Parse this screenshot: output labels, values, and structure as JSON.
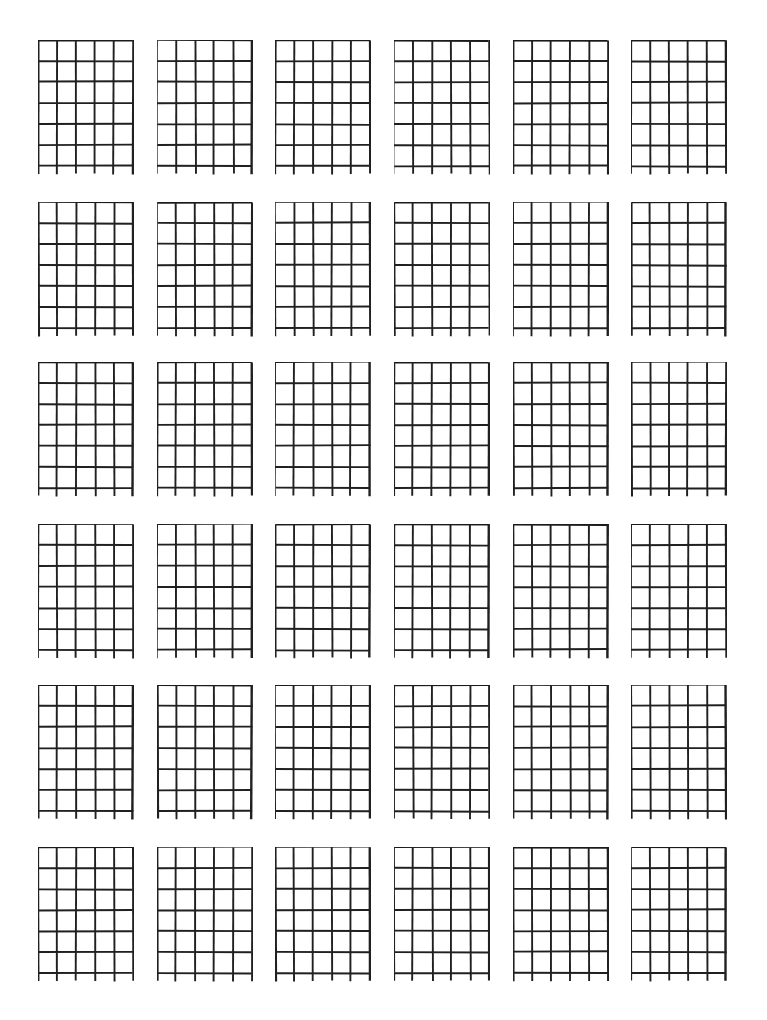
{
  "page": {
    "background_color": "#ffffff",
    "ink_color": "#211f1f",
    "width": 767,
    "height": 1020
  },
  "chart_data": {
    "type": "table",
    "subtitle": "",
    "xlabel": "",
    "ylabel": "",
    "grid_columns": 6,
    "grid_rows": 6,
    "diagram_count": 36,
    "diagram": {
      "strings": 6,
      "frets": 6,
      "fret_lines": 7,
      "nut_at_top": true,
      "string_overhang_below_last_fret_px": 8,
      "labels": [],
      "markers": []
    },
    "categories": [
      "col-1",
      "col-2",
      "col-3",
      "col-4",
      "col-5",
      "col-6"
    ],
    "values": [
      6,
      6,
      6,
      6,
      6,
      6
    ],
    "legend": [],
    "annotations": [],
    "grid": true
  },
  "layout": {
    "row_tops": [
      40,
      202,
      362,
      524,
      685,
      847
    ],
    "column_lefts": [
      38,
      157,
      275,
      394,
      513,
      631
    ],
    "diagram_width": 96,
    "diagram_height": 146,
    "fret_spacing": 21,
    "string_spacing": 19,
    "line_width_thin": 1.9,
    "line_width_thick": 2.4
  },
  "diagrams": [
    {
      "id": "chord-1",
      "row": 1,
      "col": 1,
      "name": "",
      "position": "",
      "dots": [],
      "open_strings": [],
      "muted_strings": []
    },
    {
      "id": "chord-2",
      "row": 1,
      "col": 2,
      "name": "",
      "position": "",
      "dots": [],
      "open_strings": [],
      "muted_strings": []
    },
    {
      "id": "chord-3",
      "row": 1,
      "col": 3,
      "name": "",
      "position": "",
      "dots": [],
      "open_strings": [],
      "muted_strings": []
    },
    {
      "id": "chord-4",
      "row": 1,
      "col": 4,
      "name": "",
      "position": "",
      "dots": [],
      "open_strings": [],
      "muted_strings": []
    },
    {
      "id": "chord-5",
      "row": 1,
      "col": 5,
      "name": "",
      "position": "",
      "dots": [],
      "open_strings": [],
      "muted_strings": []
    },
    {
      "id": "chord-6",
      "row": 1,
      "col": 6,
      "name": "",
      "position": "",
      "dots": [],
      "open_strings": [],
      "muted_strings": []
    },
    {
      "id": "chord-7",
      "row": 2,
      "col": 1,
      "name": "",
      "position": "",
      "dots": [],
      "open_strings": [],
      "muted_strings": []
    },
    {
      "id": "chord-8",
      "row": 2,
      "col": 2,
      "name": "",
      "position": "",
      "dots": [],
      "open_strings": [],
      "muted_strings": []
    },
    {
      "id": "chord-9",
      "row": 2,
      "col": 3,
      "name": "",
      "position": "",
      "dots": [],
      "open_strings": [],
      "muted_strings": []
    },
    {
      "id": "chord-10",
      "row": 2,
      "col": 4,
      "name": "",
      "position": "",
      "dots": [],
      "open_strings": [],
      "muted_strings": []
    },
    {
      "id": "chord-11",
      "row": 2,
      "col": 5,
      "name": "",
      "position": "",
      "dots": [],
      "open_strings": [],
      "muted_strings": []
    },
    {
      "id": "chord-12",
      "row": 2,
      "col": 6,
      "name": "",
      "position": "",
      "dots": [],
      "open_strings": [],
      "muted_strings": []
    },
    {
      "id": "chord-13",
      "row": 3,
      "col": 1,
      "name": "",
      "position": "",
      "dots": [],
      "open_strings": [],
      "muted_strings": []
    },
    {
      "id": "chord-14",
      "row": 3,
      "col": 2,
      "name": "",
      "position": "",
      "dots": [],
      "open_strings": [],
      "muted_strings": []
    },
    {
      "id": "chord-15",
      "row": 3,
      "col": 3,
      "name": "",
      "position": "",
      "dots": [],
      "open_strings": [],
      "muted_strings": []
    },
    {
      "id": "chord-16",
      "row": 3,
      "col": 4,
      "name": "",
      "position": "",
      "dots": [],
      "open_strings": [],
      "muted_strings": []
    },
    {
      "id": "chord-17",
      "row": 3,
      "col": 5,
      "name": "",
      "position": "",
      "dots": [],
      "open_strings": [],
      "muted_strings": []
    },
    {
      "id": "chord-18",
      "row": 3,
      "col": 6,
      "name": "",
      "position": "",
      "dots": [],
      "open_strings": [],
      "muted_strings": []
    },
    {
      "id": "chord-19",
      "row": 4,
      "col": 1,
      "name": "",
      "position": "",
      "dots": [],
      "open_strings": [],
      "muted_strings": []
    },
    {
      "id": "chord-20",
      "row": 4,
      "col": 2,
      "name": "",
      "position": "",
      "dots": [],
      "open_strings": [],
      "muted_strings": []
    },
    {
      "id": "chord-21",
      "row": 4,
      "col": 3,
      "name": "",
      "position": "",
      "dots": [],
      "open_strings": [],
      "muted_strings": []
    },
    {
      "id": "chord-22",
      "row": 4,
      "col": 4,
      "name": "",
      "position": "",
      "dots": [],
      "open_strings": [],
      "muted_strings": []
    },
    {
      "id": "chord-23",
      "row": 4,
      "col": 5,
      "name": "",
      "position": "",
      "dots": [],
      "open_strings": [],
      "muted_strings": []
    },
    {
      "id": "chord-24",
      "row": 4,
      "col": 6,
      "name": "",
      "position": "",
      "dots": [],
      "open_strings": [],
      "muted_strings": []
    },
    {
      "id": "chord-25",
      "row": 5,
      "col": 1,
      "name": "",
      "position": "",
      "dots": [],
      "open_strings": [],
      "muted_strings": []
    },
    {
      "id": "chord-26",
      "row": 5,
      "col": 2,
      "name": "",
      "position": "",
      "dots": [],
      "open_strings": [],
      "muted_strings": []
    },
    {
      "id": "chord-27",
      "row": 5,
      "col": 3,
      "name": "",
      "position": "",
      "dots": [],
      "open_strings": [],
      "muted_strings": []
    },
    {
      "id": "chord-28",
      "row": 5,
      "col": 4,
      "name": "",
      "position": "",
      "dots": [],
      "open_strings": [],
      "muted_strings": []
    },
    {
      "id": "chord-29",
      "row": 5,
      "col": 5,
      "name": "",
      "position": "",
      "dots": [],
      "open_strings": [],
      "muted_strings": []
    },
    {
      "id": "chord-30",
      "row": 5,
      "col": 6,
      "name": "",
      "position": "",
      "dots": [],
      "open_strings": [],
      "muted_strings": []
    },
    {
      "id": "chord-31",
      "row": 6,
      "col": 1,
      "name": "",
      "position": "",
      "dots": [],
      "open_strings": [],
      "muted_strings": []
    },
    {
      "id": "chord-32",
      "row": 6,
      "col": 2,
      "name": "",
      "position": "",
      "dots": [],
      "open_strings": [],
      "muted_strings": []
    },
    {
      "id": "chord-33",
      "row": 6,
      "col": 3,
      "name": "",
      "position": "",
      "dots": [],
      "open_strings": [],
      "muted_strings": []
    },
    {
      "id": "chord-34",
      "row": 6,
      "col": 4,
      "name": "",
      "position": "",
      "dots": [],
      "open_strings": [],
      "muted_strings": []
    },
    {
      "id": "chord-35",
      "row": 6,
      "col": 5,
      "name": "",
      "position": "",
      "dots": [],
      "open_strings": [],
      "muted_strings": []
    },
    {
      "id": "chord-36",
      "row": 6,
      "col": 6,
      "name": "",
      "position": "",
      "dots": [],
      "open_strings": [],
      "muted_strings": []
    }
  ]
}
